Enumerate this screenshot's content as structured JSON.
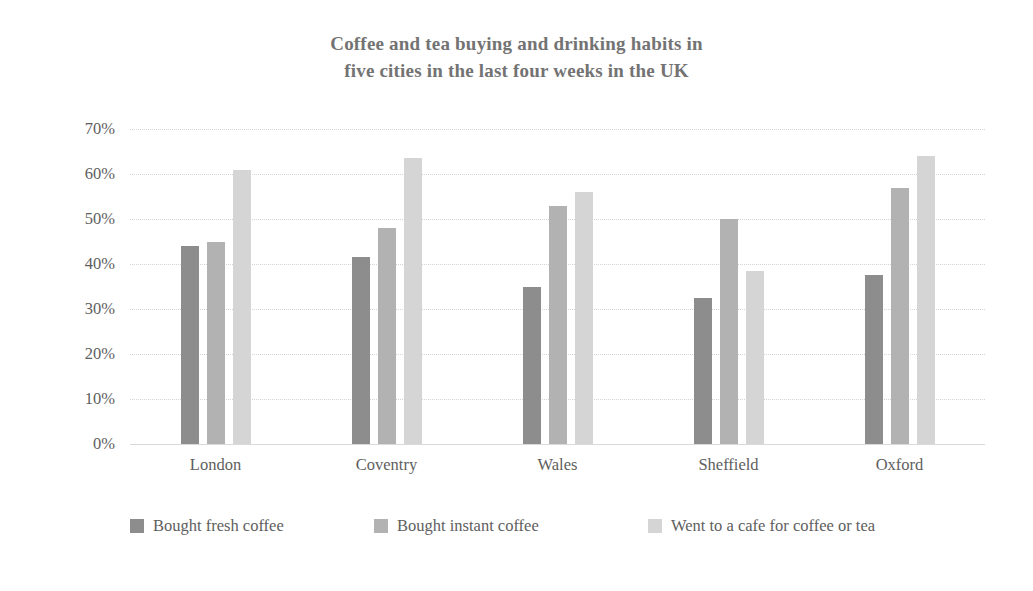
{
  "chart_data": {
    "type": "bar",
    "title": "Coffee and tea buying and drinking habits in five cities in the last four weeks in the UK",
    "title_lines": [
      "Coffee and tea buying and drinking habits in",
      "five cities in the last four weeks in the UK"
    ],
    "xlabel": "",
    "ylabel": "",
    "ylim": [
      0,
      70
    ],
    "ytick_step": 10,
    "ytick_labels": [
      "0%",
      "10%",
      "20%",
      "30%",
      "40%",
      "50%",
      "60%",
      "70%"
    ],
    "ytick_values": [
      0,
      10,
      20,
      30,
      40,
      50,
      60,
      70
    ],
    "grid": true,
    "grid_axis": "y",
    "legend_position": "bottom",
    "categories": [
      "London",
      "Coventry",
      "Wales",
      "Sheffield",
      "Oxford"
    ],
    "series": [
      {
        "name": "Bought fresh coffee",
        "color": "#8d8d8d",
        "values": [
          44,
          41.5,
          35,
          32.5,
          37.5
        ]
      },
      {
        "name": "Bought instant coffee",
        "color": "#b2b2b2",
        "values": [
          45,
          48,
          53,
          50,
          57
        ]
      },
      {
        "name": "Went to a cafe for coffee or tea",
        "color": "#d5d5d5",
        "values": [
          61,
          63.5,
          56,
          38.5,
          64
        ]
      }
    ]
  },
  "style": {
    "background": "#ffffff",
    "title_color": "#737373",
    "tick_color": "#5e5e5e",
    "grid_color": "#d4d4d4",
    "axis_color": "#d9d9d9"
  }
}
